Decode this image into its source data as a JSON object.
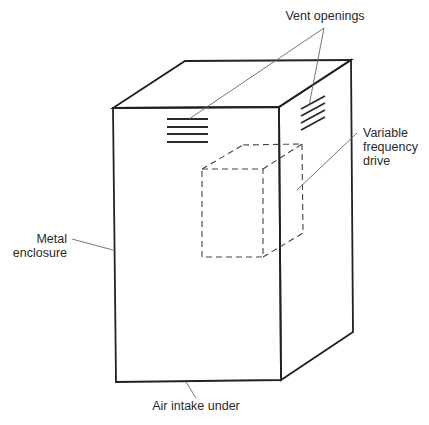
{
  "diagram": {
    "type": "labeled-illustration",
    "labels": {
      "vent_openings": "Vent openings",
      "vfd_line1": "Variable",
      "vfd_line2": "frequency",
      "vfd_line3": "drive",
      "enclosure_line1": "Metal",
      "enclosure_line2": "enclosure",
      "air_intake": "Air intake under"
    },
    "colors": {
      "line": "#222222",
      "leader": "#666666",
      "background": "#ffffff"
    }
  }
}
